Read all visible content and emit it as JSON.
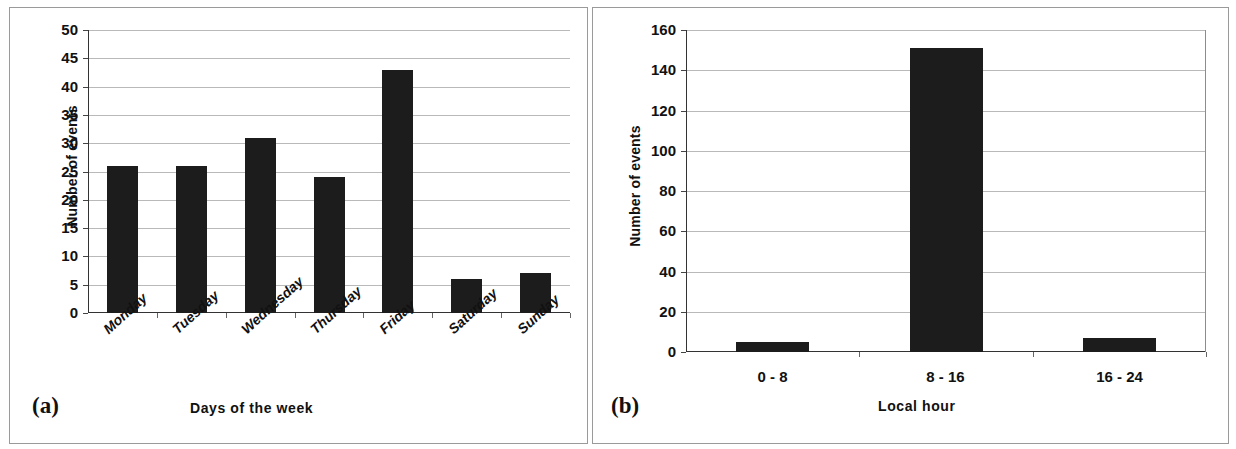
{
  "figure": {
    "panels": [
      {
        "tag": "(a)"
      },
      {
        "tag": "(b)"
      }
    ]
  },
  "chart_data": [
    {
      "type": "bar",
      "panel_tag": "(a)",
      "title": "",
      "xlabel": "Days of the week",
      "ylabel": "Number of events",
      "categories": [
        "Monday",
        "Tuesday",
        "Wednesday",
        "Thursday",
        "Friday",
        "Saturday",
        "Sunday"
      ],
      "values": [
        26,
        26,
        31,
        24,
        43,
        6,
        7
      ],
      "yticks": [
        0,
        5,
        10,
        15,
        20,
        25,
        30,
        35,
        40,
        45,
        50
      ],
      "ylim": [
        0,
        50
      ],
      "grid": true,
      "legend": false,
      "bar_color": "#1c1c1c",
      "xtick_rotation": -42
    },
    {
      "type": "bar",
      "panel_tag": "(b)",
      "title": "",
      "xlabel": "Local hour",
      "ylabel": "Number of events",
      "categories": [
        "0 - 8",
        "8 - 16",
        "16 - 24"
      ],
      "values": [
        5,
        151,
        7
      ],
      "yticks": [
        0,
        20,
        40,
        60,
        80,
        100,
        120,
        140,
        160
      ],
      "ylim": [
        0,
        160
      ],
      "grid": true,
      "legend": false,
      "bar_color": "#1c1c1c",
      "xtick_rotation": 0
    }
  ]
}
